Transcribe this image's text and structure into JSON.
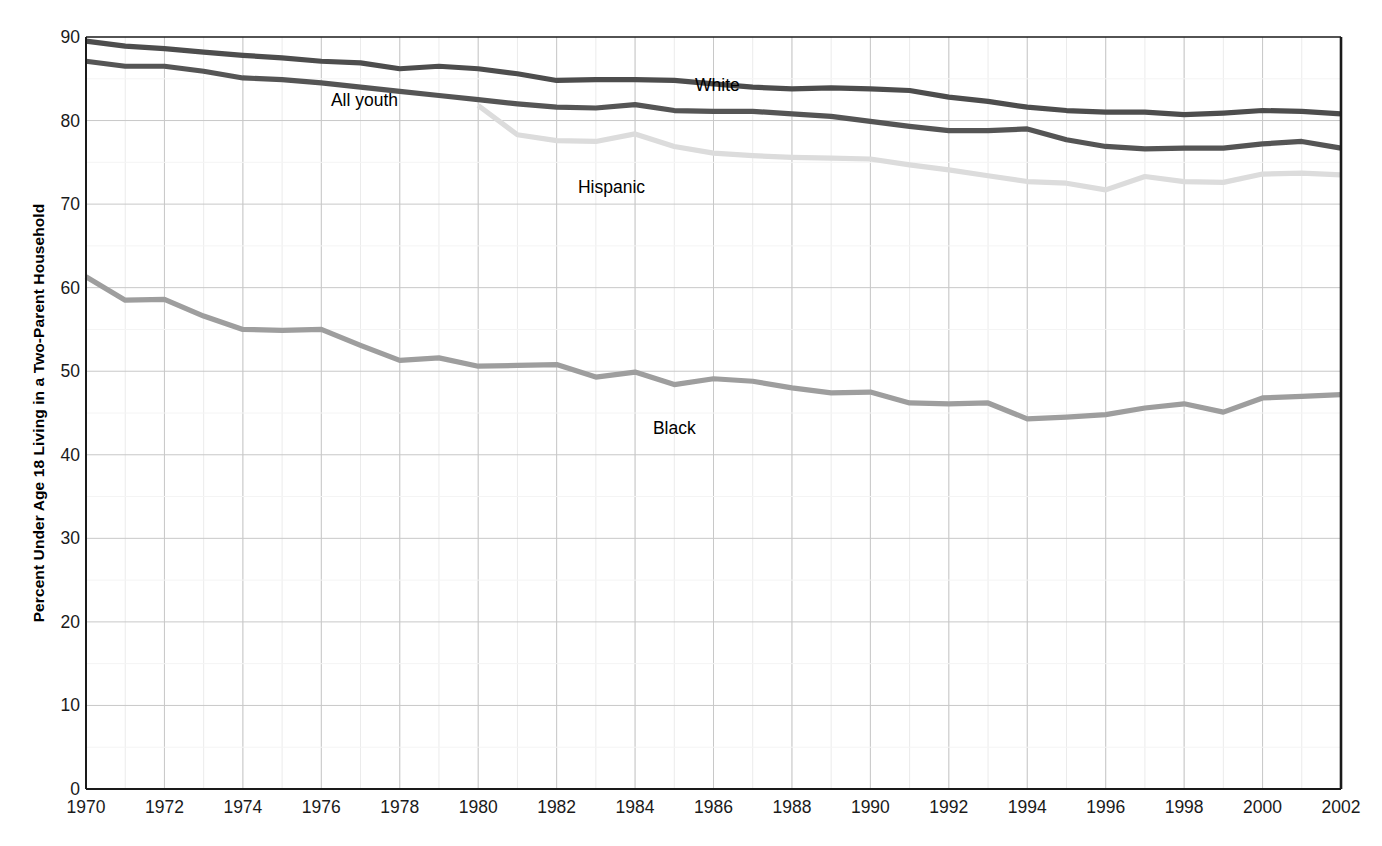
{
  "chart_data": {
    "type": "line",
    "title": "",
    "xlabel": "",
    "ylabel": "Percent Under Age 18 Living in a Two-Parent Household",
    "xlim": [
      1970,
      2002
    ],
    "ylim": [
      0,
      90
    ],
    "y_ticks": [
      0,
      10,
      20,
      30,
      40,
      50,
      60,
      70,
      80,
      90
    ],
    "x_ticks": [
      1970,
      1972,
      1974,
      1976,
      1978,
      1980,
      1982,
      1984,
      1986,
      1988,
      1990,
      1992,
      1994,
      1996,
      1998,
      2000,
      2002
    ],
    "x_minor_step": 1,
    "grid": true,
    "legend_position": "inline-labels",
    "x": [
      1970,
      1971,
      1972,
      1973,
      1974,
      1975,
      1976,
      1977,
      1978,
      1979,
      1980,
      1981,
      1982,
      1983,
      1984,
      1985,
      1986,
      1987,
      1988,
      1989,
      1990,
      1991,
      1992,
      1993,
      1994,
      1995,
      1996,
      1997,
      1998,
      1999,
      2000,
      2001,
      2002
    ],
    "series": [
      {
        "name": "White",
        "color": "#4d4d4d",
        "label_x": 1986.1,
        "label_y": 84.3,
        "values": [
          89.5,
          88.9,
          88.6,
          88.2,
          87.8,
          87.5,
          87.1,
          86.9,
          86.2,
          86.5,
          86.2,
          85.6,
          84.8,
          84.9,
          84.9,
          84.8,
          84.4,
          84.0,
          83.8,
          83.9,
          83.8,
          83.6,
          82.8,
          82.3,
          81.6,
          81.2,
          81.0,
          81.0,
          80.7,
          80.9,
          81.2,
          81.1,
          80.8
        ]
      },
      {
        "name": "All youth",
        "color": "#555555",
        "label_x": 1977.1,
        "label_y": 82.5,
        "values": [
          87.1,
          86.5,
          86.5,
          85.9,
          85.1,
          84.9,
          84.5,
          84.0,
          83.5,
          83.0,
          82.5,
          82.0,
          81.6,
          81.5,
          81.9,
          81.2,
          81.1,
          81.1,
          80.8,
          80.5,
          79.9,
          79.3,
          78.8,
          78.8,
          79.0,
          77.7,
          76.9,
          76.6,
          76.7,
          76.7,
          77.2,
          77.5,
          76.7
        ]
      },
      {
        "name": "Hispanic",
        "color": "#dcdcdc",
        "label_x": 1983.4,
        "label_y": 72.0,
        "values": [
          null,
          null,
          null,
          null,
          null,
          null,
          null,
          null,
          null,
          null,
          81.8,
          78.3,
          77.6,
          77.5,
          78.4,
          76.9,
          76.1,
          75.8,
          75.6,
          75.5,
          75.4,
          74.7,
          74.1,
          73.4,
          72.7,
          72.5,
          71.7,
          73.3,
          72.7,
          72.6,
          73.6,
          73.7,
          73.5
        ]
      },
      {
        "name": "Black",
        "color": "#9e9e9e",
        "label_x": 1985.0,
        "label_y": 43.2,
        "values": [
          61.3,
          58.5,
          58.6,
          56.6,
          55.0,
          54.9,
          55.0,
          53.1,
          51.3,
          51.6,
          50.6,
          50.7,
          50.8,
          49.3,
          49.9,
          48.4,
          49.1,
          48.8,
          48.0,
          47.4,
          47.5,
          46.2,
          46.1,
          46.2,
          44.3,
          44.5,
          44.8,
          45.6,
          46.1,
          45.1,
          46.8,
          47.0,
          47.2
        ]
      }
    ]
  },
  "axes": {
    "y_tick_labels": [
      "0",
      "10",
      "20",
      "30",
      "40",
      "50",
      "60",
      "70",
      "80",
      "90"
    ],
    "x_tick_labels": [
      "1970",
      "1972",
      "1974",
      "1976",
      "1978",
      "1980",
      "1982",
      "1984",
      "1986",
      "1988",
      "1990",
      "1992",
      "1994",
      "1996",
      "1998",
      "2000",
      "2002"
    ],
    "y_title": "Percent Under Age 18 Living in a Two-Parent Household"
  },
  "style": {
    "axis_color": "#1a1a1a",
    "grid_major_color": "#c8c8c8",
    "grid_minor_color": "#ebebeb",
    "background": "#ffffff",
    "line_width": 5.2
  }
}
